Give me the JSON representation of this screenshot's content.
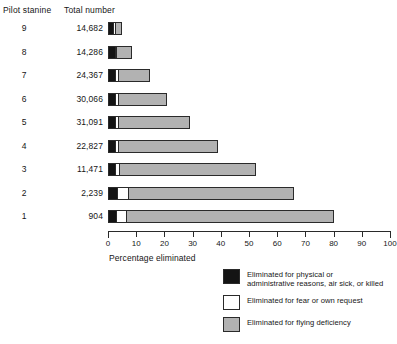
{
  "header": {
    "stanine_label": "Pilot stanine",
    "total_label": "Total number"
  },
  "axis": {
    "title": "Percentage eliminated",
    "ticks": [
      "0",
      "10",
      "20",
      "30",
      "40",
      "50",
      "60",
      "70",
      "80",
      "90",
      "100"
    ]
  },
  "rows": [
    {
      "stanine": "9",
      "total": "14,682"
    },
    {
      "stanine": "8",
      "total": "14,286"
    },
    {
      "stanine": "7",
      "total": "24,367"
    },
    {
      "stanine": "6",
      "total": "30,066"
    },
    {
      "stanine": "5",
      "total": "31,091"
    },
    {
      "stanine": "4",
      "total": "22,827"
    },
    {
      "stanine": "3",
      "total": "11,471"
    },
    {
      "stanine": "2",
      "total": "2,239"
    },
    {
      "stanine": "1",
      "total": "904"
    }
  ],
  "legend": {
    "items": [
      {
        "swatch": "black",
        "label": "Eliminated for physical or\nadministrative reasons, air sick, or killed"
      },
      {
        "swatch": "white",
        "label": "Eliminated for fear or own request"
      },
      {
        "swatch": "gray",
        "label": "Eliminated for flying deficiency"
      }
    ]
  },
  "colors": {
    "black": "#141414",
    "white": "#ffffff",
    "gray": "#b2b2b2",
    "outline": "#2a2a2a"
  },
  "chart_data": {
    "type": "bar",
    "orientation": "horizontal",
    "stacked": true,
    "title": "",
    "xlabel": "Percentage eliminated",
    "ylabel": "Pilot stanine",
    "xlim": [
      0,
      100
    ],
    "xticks": [
      0,
      10,
      20,
      30,
      40,
      50,
      60,
      70,
      80,
      90,
      100
    ],
    "grid": false,
    "legend_position": "bottom-right",
    "categories": [
      "9",
      "8",
      "7",
      "6",
      "5",
      "4",
      "3",
      "2",
      "1"
    ],
    "category_totals": [
      14682,
      14286,
      24367,
      30066,
      31091,
      22827,
      11471,
      2239,
      904
    ],
    "series": [
      {
        "name": "Eliminated for physical or administrative reasons, air sick, or killed",
        "color": "#141414",
        "values": [
          1.5,
          2.0,
          2.0,
          2.0,
          2.0,
          2.0,
          2.0,
          3.0,
          2.5
        ]
      },
      {
        "name": "Eliminated for fear or own request",
        "color": "#ffffff",
        "values": [
          1.0,
          1.0,
          1.5,
          1.5,
          1.5,
          1.5,
          2.0,
          4.0,
          4.0
        ]
      },
      {
        "name": "Eliminated for flying deficiency",
        "color": "#b2b2b2",
        "values": [
          2.5,
          5.5,
          11.5,
          17.5,
          25.5,
          35.5,
          48.5,
          59.0,
          73.5
        ]
      }
    ],
    "cumulative_totals_pct": [
      5.0,
      8.5,
      15.0,
      21.0,
      29.0,
      39.0,
      52.5,
      66.0,
      80.0
    ]
  }
}
